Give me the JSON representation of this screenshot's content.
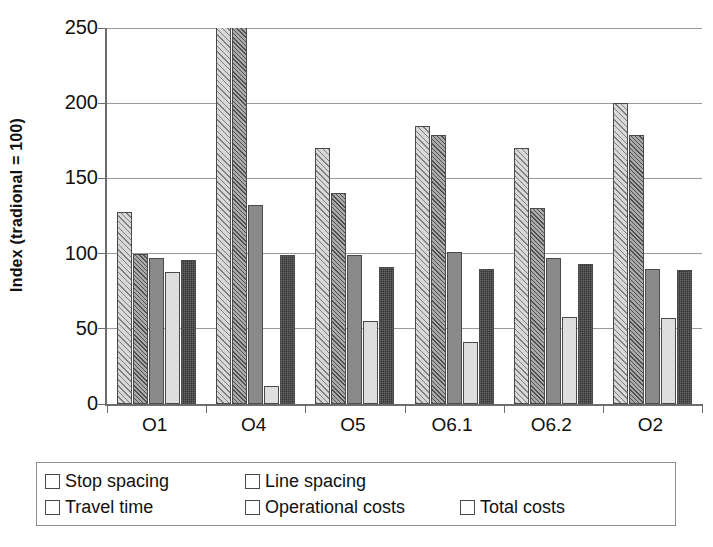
{
  "chart_data": {
    "type": "bar",
    "title": "",
    "subtitle": "",
    "xlabel": "",
    "ylabel": "Index (tradional = 100)",
    "ylim": [
      0,
      250
    ],
    "yticks": [
      0,
      50,
      100,
      150,
      200,
      250
    ],
    "ytick_labels": [
      "0",
      "50",
      "100",
      "150",
      "200",
      "250"
    ],
    "grid": "horizontal",
    "legend_position": "bottom",
    "categories": [
      "O1",
      "O4",
      "O5",
      "O6.1",
      "O6.2",
      "O2"
    ],
    "series": [
      {
        "name": "Stop spacing",
        "color": "#d8d8d8",
        "pattern": "diagonal-hatch-light",
        "values": [
          128,
          250,
          170,
          185,
          170,
          200
        ],
        "clipped": [
          false,
          true,
          false,
          false,
          false,
          false
        ]
      },
      {
        "name": "Line spacing",
        "color": "#aaaaaa",
        "pattern": "diagonal-hatch-dark",
        "values": [
          100,
          250,
          140,
          179,
          130,
          179
        ],
        "clipped": [
          false,
          true,
          false,
          false,
          false,
          false
        ]
      },
      {
        "name": "Travel time",
        "color": "#8a8a8a",
        "pattern": "solid",
        "values": [
          97,
          132,
          99,
          101,
          97,
          90
        ],
        "clipped": [
          false,
          false,
          false,
          false,
          false,
          false
        ]
      },
      {
        "name": "Operational costs",
        "color": "#dedede",
        "pattern": "solid",
        "values": [
          88,
          12,
          55,
          41,
          58,
          57
        ],
        "clipped": [
          false,
          false,
          false,
          false,
          false,
          false
        ]
      },
      {
        "name": "Total costs",
        "color": "#333333",
        "pattern": "dark-texture",
        "values": [
          96,
          99,
          91,
          90,
          93,
          89
        ],
        "clipped": [
          false,
          false,
          false,
          false,
          false,
          false
        ]
      }
    ]
  },
  "axis": {
    "y_title": "Index (tradional = 100)",
    "tick_labels": [
      "250",
      "200",
      "150",
      "100",
      "50",
      "0"
    ],
    "category_labels": [
      "O1",
      "O4",
      "O5",
      "O6.1",
      "O6.2",
      "O2"
    ]
  },
  "legend": {
    "entries": [
      {
        "label": "Stop spacing",
        "swatch": "legend-swatch-stop-spacing"
      },
      {
        "label": "Line spacing",
        "swatch": "legend-swatch-line-spacing"
      },
      {
        "label": "Travel time",
        "swatch": "legend-swatch-travel-time"
      },
      {
        "label": "Operational costs",
        "swatch": "legend-swatch-operational-costs"
      },
      {
        "label": "Total costs",
        "swatch": "legend-swatch-total-costs"
      }
    ]
  },
  "colors": {
    "stop_spacing": "#d8d8d8",
    "line_spacing": "#aaaaaa",
    "travel_time": "#8a8a8a",
    "operational_costs": "#dedede",
    "total_costs": "#333333",
    "gridline": "#9a9a9a",
    "axis": "#6d6d6d",
    "text": "#111111",
    "background": "#ffffff"
  }
}
